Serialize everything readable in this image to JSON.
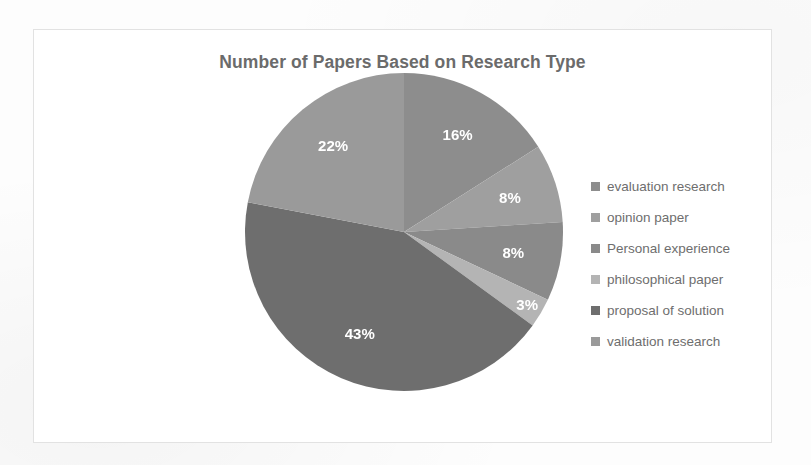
{
  "chart_data": {
    "type": "pie",
    "title": "Number of Papers Based on Research Type",
    "xlabel": "",
    "ylabel": "",
    "legend_position": "right",
    "grid": false,
    "unit": "%",
    "categories": [
      "evaluation research",
      "opinion paper",
      "Personal experience",
      "philosophical paper",
      "proposal of solution",
      "validation research"
    ],
    "values": [
      16,
      8,
      8,
      3,
      43,
      22
    ],
    "labels": [
      "16%",
      "8%",
      "8%",
      "3%",
      "43%",
      "22%"
    ],
    "colors": [
      "#8d8d8d",
      "#9f9f9f",
      "#8a8a8a",
      "#b4b4b4",
      "#6e6e6e",
      "#9a9a9a"
    ],
    "slices": [
      {
        "name": "evaluation research",
        "value": 16,
        "label": "16%",
        "color": "#8d8d8d"
      },
      {
        "name": "opinion paper",
        "value": 8,
        "label": "8%",
        "color": "#9f9f9f"
      },
      {
        "name": "Personal experience",
        "value": 8,
        "label": "8%",
        "color": "#8a8a8a"
      },
      {
        "name": "philosophical paper",
        "value": 3,
        "label": "3%",
        "color": "#b4b4b4"
      },
      {
        "name": "proposal of solution",
        "value": 43,
        "label": "43%",
        "color": "#6e6e6e"
      },
      {
        "name": "validation research",
        "value": 22,
        "label": "22%",
        "color": "#9a9a9a"
      }
    ]
  },
  "legend": {
    "items": [
      {
        "label": "evaluation research",
        "color": "#8d8d8d"
      },
      {
        "label": "opinion paper",
        "color": "#9f9f9f"
      },
      {
        "label": "Personal experience",
        "color": "#8a8a8a"
      },
      {
        "label": "philosophical paper",
        "color": "#b4b4b4"
      },
      {
        "label": "proposal of solution",
        "color": "#6e6e6e"
      },
      {
        "label": "validation research",
        "color": "#9a9a9a"
      }
    ]
  }
}
